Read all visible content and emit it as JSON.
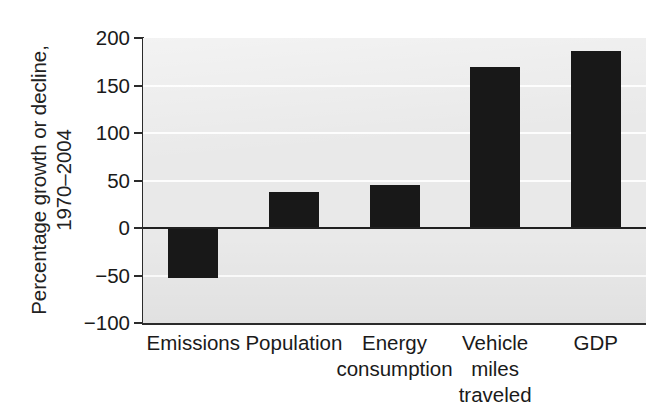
{
  "chart_data": {
    "type": "bar",
    "title": "",
    "subtitle": "",
    "xlabel": "",
    "ylabel": "Percentage growth or decline, 1970–2004",
    "ylabel_lines": [
      "Percentage growth or decline,",
      "1970–2004"
    ],
    "categories": [
      "Emissions",
      "Population",
      "Energy consumption",
      "Vehicle miles traveled",
      "GDP"
    ],
    "category_lines": [
      [
        "Emissions"
      ],
      [
        "Population"
      ],
      [
        "Energy",
        "consumption"
      ],
      [
        "Vehicle",
        "miles",
        "traveled"
      ],
      [
        "GDP"
      ]
    ],
    "values": [
      -53,
      38,
      45,
      170,
      186
    ],
    "ylim": [
      -100,
      200
    ],
    "yticks": [
      200,
      150,
      100,
      50,
      0,
      -50,
      -100
    ],
    "ytick_labels": [
      "200",
      "150",
      "100",
      "50",
      "0",
      "−50",
      "−100"
    ],
    "grid": true,
    "grid_axis": "y",
    "legend": "none",
    "zero_line": 0,
    "bar_color": "#181818",
    "plot_background": "#e9e9e9",
    "gridline_color": "#fdfdfd",
    "axis_color": "#2b2b2b",
    "page_background": "#ffffff"
  }
}
